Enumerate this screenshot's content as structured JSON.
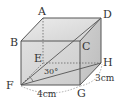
{
  "diagram": {
    "type": "cuboid",
    "vertices": {
      "A": {
        "label": "A",
        "x": 43,
        "y": 18
      },
      "B": {
        "label": "B",
        "x": 21,
        "y": 41
      },
      "C": {
        "label": "C",
        "x": 80,
        "y": 41
      },
      "D": {
        "label": "D",
        "x": 101,
        "y": 18
      },
      "E": {
        "label": "E",
        "x": 43,
        "y": 63
      },
      "F": {
        "label": "F",
        "x": 21,
        "y": 85
      },
      "G": {
        "label": "G",
        "x": 80,
        "y": 85
      },
      "H": {
        "label": "H",
        "x": 101,
        "y": 63
      }
    },
    "dimensions": {
      "FG": "4cm",
      "GH": "3cm"
    },
    "angle": {
      "label": "30°",
      "between": [
        "FD",
        "FH"
      ]
    },
    "colors": {
      "face_fill": "#d4d4d4",
      "top_fill": "#e2e2e2",
      "side_fill": "#c8c8c8",
      "edge": "#555555",
      "hidden": "#666666"
    }
  }
}
